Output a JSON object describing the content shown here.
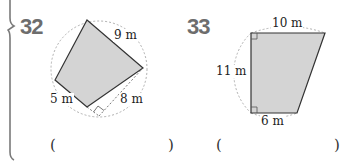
{
  "problems": [
    {
      "number": "32",
      "labels": {
        "top_right": "9 m",
        "bottom_left": "5 m",
        "bottom_right": "8 m"
      },
      "answer_open": "(",
      "answer_close": ")"
    },
    {
      "number": "33",
      "labels": {
        "top": "10 m",
        "left": "11 m",
        "bottom": "6 m"
      },
      "answer_open": "(",
      "answer_close": ")"
    }
  ],
  "colors": {
    "shape_fill": "#d4d4d4",
    "outline": "#333333",
    "dotted": "#aaaaaa",
    "number": "#6d6d6d",
    "bracket": "#7a7a7a"
  }
}
